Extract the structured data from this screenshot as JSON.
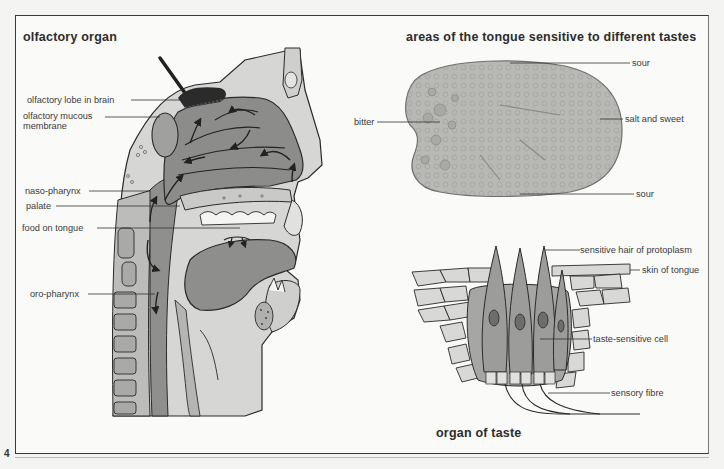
{
  "page": {
    "number": "4"
  },
  "olfactory": {
    "title": "olfactory organ",
    "labels": [
      "olfactory lobe in brain",
      "olfactory mucous",
      "membrane",
      "naso-pharynx",
      "palate",
      "food on tongue",
      "oro-pharynx"
    ]
  },
  "tongue_map": {
    "title": "areas of the tongue sensitive to different tastes",
    "labels": {
      "top": "sour",
      "left": "bitter",
      "right": "salt and sweet",
      "bottom": "sour"
    }
  },
  "taste_organ": {
    "title": "organ of taste",
    "labels": {
      "hair": "sensitive hair of protoplasm",
      "skin": "skin of tongue",
      "cell": "taste-sensitive cell",
      "fibre": "sensory fibre"
    }
  },
  "colors": {
    "line": "#2a2a2a",
    "dark_tissue": "#8c8c8c",
    "mid_tissue": "#a8a8a8",
    "light_tissue": "#cfcfcf",
    "paper": "#fafaf8"
  }
}
